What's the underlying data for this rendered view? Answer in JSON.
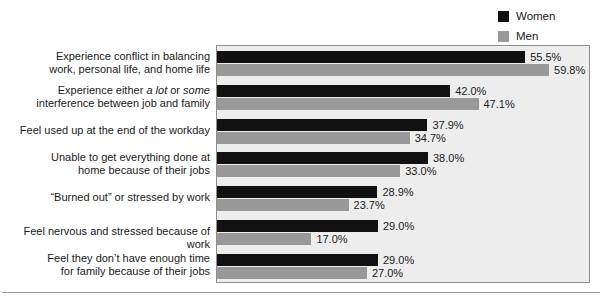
{
  "legend": {
    "items": [
      {
        "label": "Women",
        "color": "#111111",
        "icon": "square-swatch-icon"
      },
      {
        "label": "Men",
        "color": "#999999",
        "icon": "square-swatch-icon"
      }
    ]
  },
  "chart_data": {
    "type": "bar",
    "orientation": "horizontal",
    "title": "",
    "subtitle": "",
    "xlabel": "",
    "ylabel": "",
    "xlim": [
      0,
      67
    ],
    "grid": false,
    "legend_position": "top-right",
    "value_format": "percent-one-decimal",
    "categories": [
      "Experience conflict in balancing work, personal life, and home life",
      "Experience either a lot or some interference between job and family",
      "Feel used up at the end of the workday",
      "Unable to get everything done at home because of their jobs",
      "“Burned out” or stressed by work",
      "Feel nervous and stressed because of work",
      "Feel they don’t have enough time for family because of their jobs"
    ],
    "category_lines": [
      [
        "Experience conflict in balancing",
        "work, personal life, and home life"
      ],
      [
        "Experience either |a lot| or |some|",
        "interference between job and family"
      ],
      [
        "Feel used up at the end of the workday"
      ],
      [
        "Unable to get everything done at",
        "home because of their jobs"
      ],
      [
        "“Burned out” or stressed by work"
      ],
      [
        "Feel nervous and stressed because of work"
      ],
      [
        "Feel they don’t have enough time",
        "for family because of their jobs"
      ]
    ],
    "series": [
      {
        "name": "Women",
        "color": "#111111",
        "values": [
          55.5,
          42.0,
          37.9,
          38.0,
          28.9,
          29.0,
          29.0
        ],
        "labels": [
          "55.5%",
          "42.0%",
          "37.9%",
          "38.0%",
          "28.9%",
          "29.0%",
          "29.0%"
        ]
      },
      {
        "name": "Men",
        "color": "#999999",
        "values": [
          59.8,
          47.1,
          34.7,
          33.0,
          23.7,
          17.0,
          27.0
        ],
        "labels": [
          "59.8%",
          "47.1%",
          "34.7%",
          "33.0%",
          "23.7%",
          "17.0%",
          "27.0%"
        ]
      }
    ]
  },
  "colors": {
    "plot_background": "#ededed",
    "plot_border": "#8d8d8d",
    "women_bar": "#111111",
    "men_bar": "#999999",
    "text": "#1a1a1a",
    "rule": "#9a9a9a"
  }
}
